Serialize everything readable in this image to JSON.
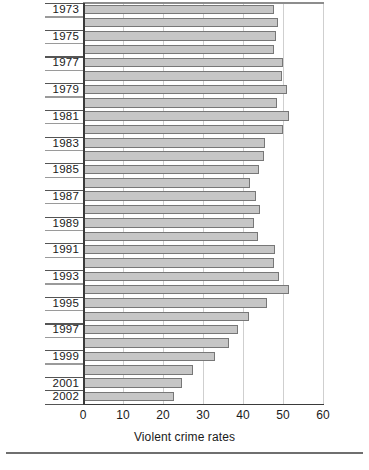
{
  "chart_data": {
    "type": "bar",
    "orientation": "horizontal",
    "title": "",
    "xlabel": "Violent crime rates",
    "ylabel": "",
    "xlim": [
      0,
      60
    ],
    "xticks": [
      0,
      10,
      20,
      30,
      40,
      50,
      60
    ],
    "xticklabels": [
      "0",
      "10",
      "20",
      "30",
      "40",
      "50",
      "60"
    ],
    "grid": "vertical-dotted",
    "legend": "none",
    "categories": [
      "1973",
      "1974",
      "1975",
      "1976",
      "1977",
      "1978",
      "1979",
      "1980",
      "1981",
      "1982",
      "1983",
      "1984",
      "1985",
      "1986",
      "1987",
      "1988",
      "1989",
      "1990",
      "1991",
      "1992",
      "1993",
      "1994",
      "1995",
      "1996",
      "1997",
      "1998",
      "1999",
      "2000",
      "2001",
      "2002"
    ],
    "visible_tick_labels": [
      "1973",
      "1975",
      "1977",
      "1979",
      "1981",
      "1983",
      "1985",
      "1987",
      "1989",
      "1991",
      "1993",
      "1995",
      "1997",
      "1999",
      "2001",
      "2002"
    ],
    "values": [
      47.8,
      48.8,
      48.3,
      47.8,
      50.0,
      49.8,
      51.0,
      48.4,
      51.5,
      49.9,
      45.6,
      45.3,
      43.9,
      41.7,
      43.3,
      44.3,
      42.8,
      43.7,
      48.0,
      47.8,
      49.1,
      51.5,
      46.0,
      41.5,
      38.8,
      36.5,
      32.9,
      27.4,
      24.8,
      22.8
    ],
    "bar_color": "#c6c6c6",
    "bar_edge_color": "#777777",
    "axis_color": "#3a3a3a",
    "gridline_color": "#cfcfcf"
  },
  "footer": {
    "caption": ""
  }
}
